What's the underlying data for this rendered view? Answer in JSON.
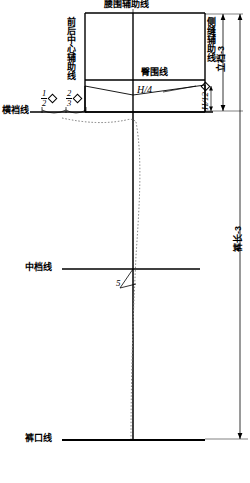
{
  "diagram": {
    "type": "garment-pattern-draft",
    "title_top": "腰围辅助线",
    "labels": {
      "waist_aux_line": "腰围辅助线",
      "center_front_back_aux_line": "前后中心辅助线",
      "side_seam_aux_line": "侧缝辅助线",
      "hip_line": "臀围线",
      "crotch_line": "横裆线",
      "mid_thigh_line": "中档线",
      "hem_line": "裤口线"
    },
    "dimensions": {
      "rise_minus_3": "立裆-3",
      "pant_length_minus_3": "裤长-3",
      "hip_quarter": "H/4",
      "hip_twelfth": "H/12",
      "front_crotch_ext_num": "1",
      "front_crotch_ext_den": "2",
      "back_crotch_ext_num": "2",
      "back_crotch_ext_den": "3",
      "knee_offset": "5"
    },
    "symbols": {
      "diamond": "◇"
    },
    "colors": {
      "ink": "#000000",
      "paper": "#ffffff",
      "guide": "#555555"
    }
  }
}
